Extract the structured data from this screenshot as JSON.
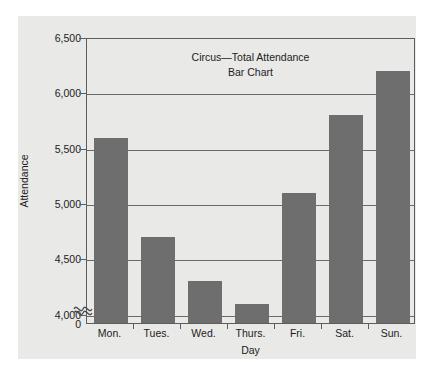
{
  "chart_data": {
    "type": "bar",
    "title": "Circus—Total Attendance",
    "subtitle": "Bar Chart",
    "xlabel": "Day",
    "ylabel": "Attendance",
    "categories": [
      "Mon.",
      "Tues.",
      "Wed.",
      "Thurs.",
      "Fri.",
      "Sat.",
      "Sun."
    ],
    "values": [
      5600,
      4700,
      4300,
      4100,
      5100,
      5800,
      6200
    ],
    "ylim": [
      4000,
      6500
    ],
    "y_ticks": [
      "6,500",
      "6,000",
      "5,500",
      "5,000",
      "4,500",
      "4,000"
    ],
    "y_tick_values": [
      6500,
      6000,
      5500,
      5000,
      4500,
      4000
    ],
    "zero_tick": "0",
    "axis_break": true,
    "axis_break_symbol": "≈",
    "grid": true,
    "legend": null,
    "bar_color": "#6e6e6e",
    "panel_color": "#e9e9e7",
    "axis_color": "#5d5d5d"
  }
}
